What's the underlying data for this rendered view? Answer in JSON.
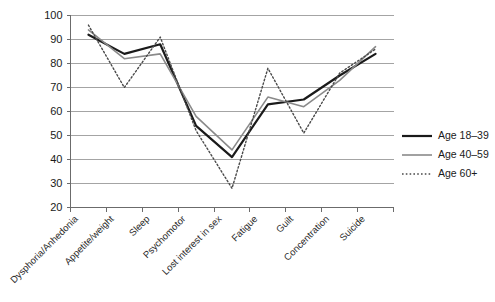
{
  "chart_data": {
    "type": "line",
    "title": "",
    "subtitle": "",
    "xlabel": "",
    "ylabel": "",
    "ylim": [
      20,
      100
    ],
    "ytick_step": 10,
    "yticks": [
      20,
      30,
      40,
      50,
      60,
      70,
      80,
      90,
      100
    ],
    "grid": true,
    "grid_axis": "y",
    "legend_position": "right",
    "categories": [
      "Dysphoria/Anhedonia",
      "Appetite/weight",
      "Sleep",
      "Psychomotor",
      "Lost interest in sex",
      "Fatigue",
      "Guilt",
      "Concentration",
      "Suicide"
    ],
    "series": [
      {
        "name": "Age 18–39",
        "style": "solid",
        "color": "#1a1a1a",
        "width": 2.2,
        "values": [
          92,
          84,
          88,
          54,
          41,
          63,
          65,
          75,
          84
        ]
      },
      {
        "name": "Age 40–59",
        "style": "solid",
        "color": "#8a8a8a",
        "width": 1.6,
        "values": [
          94,
          82,
          84,
          58,
          44,
          66,
          62,
          73,
          87
        ]
      },
      {
        "name": "Age 60+",
        "style": "dotted",
        "color": "#4a4a4a",
        "width": 1.4,
        "values": [
          96,
          70,
          91,
          52,
          28,
          78,
          51,
          76,
          86
        ]
      }
    ]
  },
  "legend": {
    "items": [
      {
        "label": "Age 18–39"
      },
      {
        "label": "Age 40–59"
      },
      {
        "label": "Age 60+"
      }
    ]
  },
  "axes": {
    "y_labels": [
      "100",
      "90",
      "80",
      "70",
      "60",
      "50",
      "40",
      "30",
      "20"
    ],
    "x_labels": [
      "Dysphoria/Anhedonia",
      "Appetite/weight",
      "Sleep",
      "Psychomotor",
      "Lost interest in sex",
      "Fatigue",
      "Guilt",
      "Concentration",
      "Suicide"
    ]
  }
}
